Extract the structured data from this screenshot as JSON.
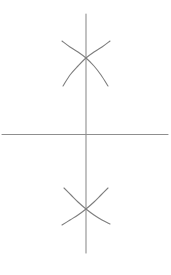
{
  "figure": {
    "title": "",
    "background_color": "#ffffff",
    "width": 171,
    "height": 275,
    "stroke_color": "#8a8a8a",
    "axis_color": "#8f8f8f",
    "curve_color": "#7e7e7e",
    "stroke_width": 1.1
  },
  "chart_data": {
    "type": "line",
    "title": "",
    "subtitle": "",
    "xlabel": "",
    "ylabel": "",
    "xlim": [
      -86,
      85
    ],
    "ylim": [
      -120,
      134
    ],
    "grid": false,
    "legend": "none",
    "annotations": [],
    "axes": [
      {
        "name": "horizontal-axis",
        "orientation": "horizontal",
        "x_start": 2,
        "x_end": 168,
        "y": 134.5,
        "tick_labels": []
      },
      {
        "name": "vertical-axis",
        "orientation": "vertical",
        "x": 86,
        "y_start": 14,
        "y_end": 253,
        "tick_labels": []
      }
    ],
    "series": [
      {
        "name": "upper-arc-falling",
        "crossing_point": [
          86,
          58
        ],
        "points": [
          [
            62,
            41
          ],
          [
            70,
            47
          ],
          [
            78,
            52
          ],
          [
            86,
            58
          ],
          [
            94,
            66
          ],
          [
            101,
            75
          ],
          [
            108,
            86
          ]
        ]
      },
      {
        "name": "upper-arc-rising",
        "crossing_point": [
          86,
          58
        ],
        "points": [
          [
            63,
            86
          ],
          [
            70,
            75
          ],
          [
            78,
            66
          ],
          [
            86,
            58
          ],
          [
            94,
            52
          ],
          [
            102,
            47
          ],
          [
            110,
            41
          ]
        ]
      },
      {
        "name": "lower-arc-falling",
        "crossing_point": [
          86,
          209
        ],
        "points": [
          [
            64,
            188
          ],
          [
            71,
            195
          ],
          [
            78,
            202
          ],
          [
            86,
            209
          ],
          [
            94,
            215
          ],
          [
            102,
            220
          ],
          [
            110,
            224
          ]
        ]
      },
      {
        "name": "lower-arc-rising",
        "crossing_point": [
          86,
          209
        ],
        "points": [
          [
            62,
            225
          ],
          [
            70,
            220
          ],
          [
            78,
            215
          ],
          [
            86,
            209
          ],
          [
            94,
            202
          ],
          [
            101,
            195
          ],
          [
            108,
            188
          ]
        ]
      }
    ]
  }
}
